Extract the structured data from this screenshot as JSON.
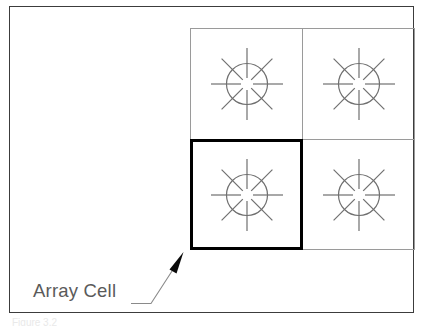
{
  "figure": {
    "background_color": "#ffffff",
    "frame": {
      "border_color": "#3c3c3c",
      "name": "figure-border"
    },
    "annotation": {
      "label": "Array Cell",
      "label_color": "#5a5a5a",
      "leader_line_color": "#8a8a8a",
      "arrow_color": "#000000"
    },
    "bottom_caption_fragment": "Figure 3.2",
    "grid": {
      "rows": 2,
      "columns": 2,
      "cell_border_color": "#9a9a9a",
      "highlight_border_color": "#000000",
      "symbol_color": "#6f6f6f",
      "symbol_name": "starburst-circle-symbol",
      "cells": [
        {
          "row": 0,
          "col": 0,
          "name": "array-cell-r0c0",
          "highlighted": false
        },
        {
          "row": 0,
          "col": 1,
          "name": "array-cell-r0c1",
          "highlighted": false
        },
        {
          "row": 1,
          "col": 0,
          "name": "array-cell-r1c0",
          "highlighted": true
        },
        {
          "row": 1,
          "col": 1,
          "name": "array-cell-r1c1",
          "highlighted": false
        }
      ]
    }
  }
}
